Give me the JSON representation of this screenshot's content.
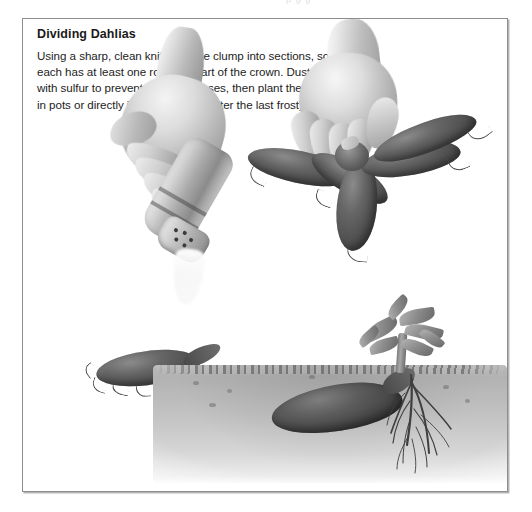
{
  "page": {
    "background_color": "#ffffff",
    "cropped_header_text": "p g g"
  },
  "sidebar": {
    "title": "Dividing Dahlias",
    "body": "Using a sharp, clean knife, cut the clump into sections, so that\neach has at least one root and part  of the crown. Dust the cuts\nwith sulfur to prevent fungal diseases, then plant the divisions\nin pots or directly into the garden (after the last frost).",
    "border_color": "#8d8d8d",
    "title_color": "#1a1a1a",
    "body_color": "#1d1d1d"
  },
  "illustration": {
    "style": "grayscale pencil and airbrush botanical illustration",
    "figures": [
      {
        "name": "hand-dusting-sulfur",
        "description": "A hand tilting a perforated sulfur shaker, dusting white powder onto a dahlia tuber below"
      },
      {
        "name": "tuber-being-dusted",
        "description": "A single dark dahlia tuber with fine rootlets receiving sulfur dust"
      },
      {
        "name": "hand-holding-clump",
        "description": "A hand gripping the crown of a divided dahlia tuber clump with five tubers radiating outward"
      },
      {
        "name": "planted-division",
        "description": "Cross-section of a dahlia tuber planted horizontally in soil with roots below and a leafy shoot above the soil line"
      }
    ],
    "colors": {
      "tuber_dark": "#3c3c3c",
      "tuber_mid": "#666666",
      "skin_light": "#f4f4f4",
      "skin_shadow": "#8e8e8e",
      "soil_mid": "#c2c2c2",
      "soil_line": "#696969",
      "powder_white": "#ffffff"
    }
  }
}
